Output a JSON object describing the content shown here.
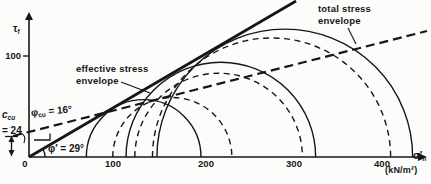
{
  "figure": {
    "y_axis": {
      "label_main": "τ",
      "label_sub": "f",
      "tick_100": "100"
    },
    "x_axis": {
      "label_main": "σ′",
      "label_sub": "n",
      "unit": "(kN/m²)",
      "ticks": [
        "0",
        "100",
        "200",
        "300",
        "400"
      ]
    },
    "labels": {
      "effective_envelope_line1": "effective stress",
      "effective_envelope_line2": "envelope",
      "total_envelope_line1": "total stress",
      "total_envelope_line2": "envelope",
      "phi_cu_sym": "φ",
      "phi_cu_sub": "cu",
      "phi_cu_eq": " = 16°",
      "phi_eff": "φ′ = 29°",
      "c_cu_sym": "c",
      "c_cu_sub": "cu",
      "c_cu_eq": "= 24"
    },
    "colors": {
      "ink": "#161616",
      "paper": "#fcfcfa"
    }
  },
  "chart_data": {
    "type": "line",
    "subtype": "mohr_circle_failure_envelopes",
    "title": "",
    "xlabel": "σ′n (kN/m²)",
    "ylabel": "τf",
    "xlim": [
      0,
      450
    ],
    "ylim": [
      0,
      155
    ],
    "x_ticks": [
      0,
      100,
      200,
      300,
      400
    ],
    "y_ticks": [
      100
    ],
    "grid": false,
    "envelopes": [
      {
        "name": "effective stress envelope",
        "line_style": "solid",
        "cohesion_kN_m2": 0,
        "friction_angle_deg": 29,
        "annotation": "φ′ = 29°"
      },
      {
        "name": "total stress envelope",
        "line_style": "dashed",
        "cohesion_kN_m2": 24,
        "friction_angle_deg": 16,
        "annotation": "φcu = 16°"
      }
    ],
    "mohr_circles": {
      "effective_stress_solid": [
        {
          "sigma3": 65,
          "sigma1": 195
        },
        {
          "sigma3": 110,
          "sigma1": 325
        },
        {
          "sigma3": 145,
          "sigma1": 435
        }
      ],
      "total_stress_dashed": [
        {
          "sigma3": 95,
          "sigma1": 230
        },
        {
          "sigma3": 120,
          "sigma1": 310
        },
        {
          "sigma3": 140,
          "sigma1": 410
        }
      ]
    },
    "annotations": [
      "ccu = 24"
    ]
  }
}
